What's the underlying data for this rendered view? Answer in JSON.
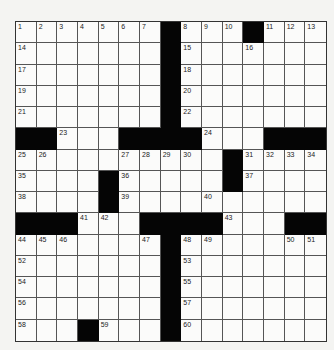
{
  "puzzle": {
    "rows": 15,
    "cols": 15,
    "grid": [
      "1,2,3,4,5,6,7,#,8,9,10,#,11,12,13",
      "14,,,,,,,#,15,,,16,,,",
      "17,,,,,,,#,18,,,,,,",
      "19,,,,,,,#,20,,,,,,",
      "21,,,,,,,#,22,,,,,,",
      "#,#,23,,,#,#,#,#,24,,,#,#,#",
      "25,26,,,,27,28,29,30,,#,31,32,33,34",
      "35,,,,#,36,,,,,#,37,,,",
      "38,,,,#,39,,,,40,,,,,",
      "#,#,#,41,42,,#,#,#,#,43,,,#,#",
      "44,45,46,,,,47,#,48,49,,,,50,51",
      "52,,,,,,,#,53,,,,,,",
      "54,,,,,,,#,55,,,,,,",
      "56,,,,,,,#,57,,,,,,",
      "58,,,#,59,,,#,60,,,,,,"
    ]
  },
  "colors": {
    "black": "#050505",
    "cell": "#fbfbfa",
    "background": "#f4f4f2"
  }
}
